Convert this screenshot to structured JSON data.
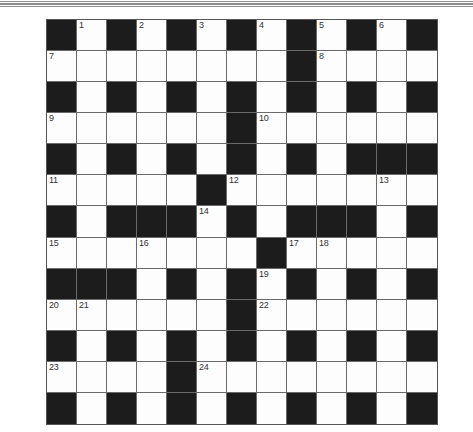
{
  "puzzle": {
    "type": "crossword",
    "rows": 13,
    "cols": 13,
    "colors": {
      "black_cell": "#1c1c1c",
      "white_cell": "#fdfdfd",
      "grid_line": "#6a6a6a",
      "number_text": "#333333",
      "header_rule": "#8a8a8a"
    },
    "grid": [
      [
        "#",
        "1",
        "#",
        "2",
        "#",
        "3",
        "#",
        "4",
        "#",
        "5",
        "#",
        "6",
        "#"
      ],
      [
        "7",
        ".",
        ".",
        ".",
        ".",
        ".",
        ".",
        ".",
        "#",
        "8",
        ".",
        ".",
        "."
      ],
      [
        "#",
        ".",
        "#",
        ".",
        "#",
        ".",
        "#",
        ".",
        "#",
        ".",
        "#",
        ".",
        "#"
      ],
      [
        "9",
        ".",
        ".",
        ".",
        ".",
        ".",
        "#",
        "10",
        ".",
        ".",
        ".",
        ".",
        "."
      ],
      [
        "#",
        ".",
        "#",
        ".",
        "#",
        ".",
        "#",
        ".",
        "#",
        ".",
        "#",
        "#",
        "#"
      ],
      [
        "11",
        ".",
        ".",
        ".",
        ".",
        "#",
        "12",
        ".",
        ".",
        ".",
        ".",
        "13",
        "."
      ],
      [
        "#",
        ".",
        "#",
        "#",
        "#",
        "14",
        "#",
        ".",
        "#",
        "#",
        "#",
        ".",
        "#"
      ],
      [
        "15",
        ".",
        ".",
        "16",
        ".",
        ".",
        ".",
        "#",
        "17",
        "18",
        ".",
        ".",
        "."
      ],
      [
        "#",
        "#",
        "#",
        ".",
        "#",
        ".",
        "#",
        "19",
        "#",
        ".",
        "#",
        ".",
        "#"
      ],
      [
        "20",
        "21",
        ".",
        ".",
        ".",
        ".",
        "#",
        "22",
        ".",
        ".",
        ".",
        ".",
        "."
      ],
      [
        "#",
        ".",
        "#",
        ".",
        "#",
        ".",
        "#",
        ".",
        "#",
        ".",
        "#",
        ".",
        "#"
      ],
      [
        "23",
        ".",
        ".",
        ".",
        "#",
        "24",
        ".",
        ".",
        ".",
        ".",
        ".",
        ".",
        "."
      ],
      [
        "#",
        ".",
        "#",
        ".",
        "#",
        ".",
        "#",
        ".",
        "#",
        ".",
        "#",
        ".",
        "#"
      ]
    ],
    "clue_numbers": [
      "1",
      "2",
      "3",
      "4",
      "5",
      "6",
      "7",
      "8",
      "9",
      "10",
      "11",
      "12",
      "13",
      "14",
      "15",
      "16",
      "17",
      "18",
      "19",
      "20",
      "21",
      "22",
      "23",
      "24"
    ]
  }
}
